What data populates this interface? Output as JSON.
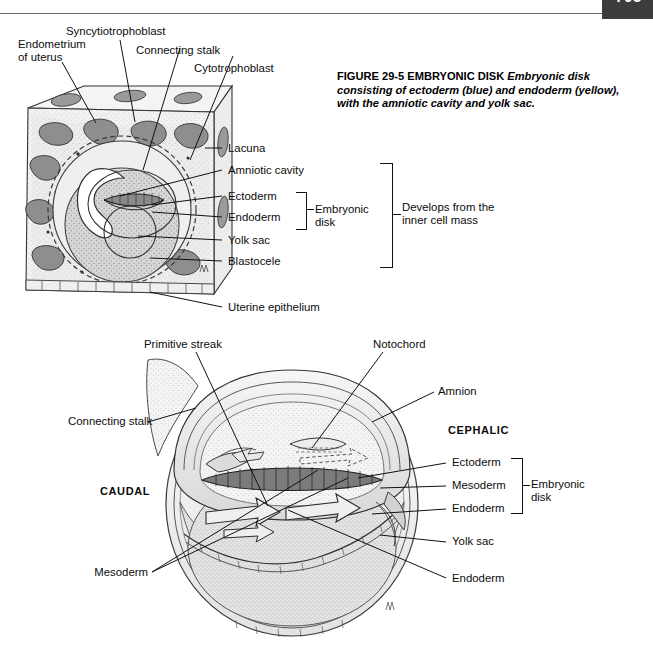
{
  "page": {
    "number": "705",
    "background": "#ffffff",
    "tab_color": "#3d3d3d",
    "rule_color": "#6d6d6d"
  },
  "caption": {
    "lead": "FIGURE 29-5 EMBRYONIC DISK ",
    "body": "Embryonic disk consisting of ectoderm (blue) and endoderm (yellow), with the amniotic cavity and yolk sac."
  },
  "figure_top": {
    "labels": {
      "endometrium": "Endometrium\nof uterus",
      "syncytiotrophoblast": "Syncytiotrophoblast",
      "connecting_stalk": "Connecting stalk",
      "cytotrophoblast": "Cytotrophoblast",
      "lacuna": "Lacuna",
      "amniotic_cavity": "Amniotic cavity",
      "ectoderm": "Ectoderm",
      "endoderm": "Endoderm",
      "yolk_sac": "Yolk sac",
      "blastocele": "Blastocele",
      "uterine_epithelium": "Uterine epithelium",
      "embryonic_disk": "Embryonic\ndisk",
      "inner_cell_mass": "Develops from the\ninner cell mass"
    }
  },
  "figure_bottom": {
    "labels": {
      "primitive_streak": "Primitive streak",
      "notochord": "Notochord",
      "connecting_stalk": "Connecting stalk",
      "amnion": "Amnion",
      "cephalic": "CEPHALIC",
      "caudal": "CAUDAL",
      "ectoderm": "Ectoderm",
      "mesoderm": "Mesoderm",
      "endoderm": "Endoderm",
      "embryonic_disk": "Embryonic\ndisk",
      "yolk_sac": "Yolk sac",
      "mesoderm_lower": "Mesoderm",
      "endoderm_lower": "Endoderm"
    }
  }
}
